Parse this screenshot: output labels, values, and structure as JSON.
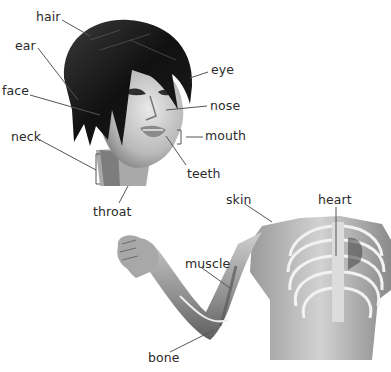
{
  "diagram": {
    "title": "",
    "sections": [
      {
        "name": "head",
        "labels": [
          {
            "id": "hair",
            "text": "hair"
          },
          {
            "id": "ear",
            "text": "ear"
          },
          {
            "id": "face",
            "text": "face"
          },
          {
            "id": "eye",
            "text": "eye"
          },
          {
            "id": "nose",
            "text": "nose"
          },
          {
            "id": "mouth",
            "text": "mouth"
          },
          {
            "id": "neck",
            "text": "neck"
          },
          {
            "id": "teeth",
            "text": "teeth"
          },
          {
            "id": "throat",
            "text": "throat"
          }
        ]
      },
      {
        "name": "body",
        "labels": [
          {
            "id": "skin",
            "text": "skin"
          },
          {
            "id": "heart",
            "text": "heart"
          },
          {
            "id": "muscle",
            "text": "muscle"
          },
          {
            "id": "bone",
            "text": "bone"
          }
        ]
      }
    ],
    "colors": {
      "label_text": "#2b2b2b",
      "leader_line": "#555555",
      "background": "#ffffff"
    }
  }
}
